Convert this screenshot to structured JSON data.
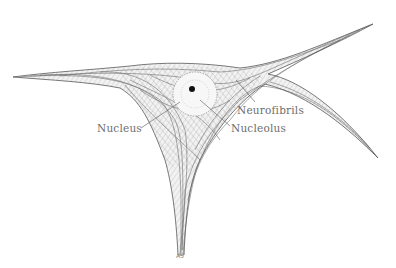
{
  "figure": {
    "labels": {
      "neurofibrils": "Neurofibrils",
      "nucleolus": "Nucleolus",
      "nucleus": "Nucleus"
    },
    "signature": "AS",
    "colors": {
      "ink": "#3a3a3a",
      "fibril": "#6a6a6a",
      "label": "#6e6e6e",
      "background": "#ffffff"
    }
  }
}
